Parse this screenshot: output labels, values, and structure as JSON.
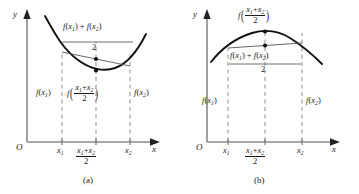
{
  "figure": {
    "colors": {
      "axis": "#8a8a8a",
      "curve": "#111111",
      "chord": "#555555",
      "dashed": "#9a9a9a",
      "text": "#1a1a1a",
      "background": "#ffffff"
    },
    "panels": [
      {
        "id": "a",
        "caption": "(a)",
        "kind": "convex",
        "axis": {
          "y_label": "y",
          "x_label": "x",
          "origin_label": "O"
        },
        "ticks": [
          {
            "name": "x1",
            "num": "x",
            "sub": "1"
          },
          {
            "name": "midpoint",
            "num_a": "x",
            "sub_a": "1",
            "op": "+",
            "num_b": "x",
            "sub_b": "2",
            "den": "2"
          },
          {
            "name": "x2",
            "num": "x",
            "sub": "2"
          }
        ],
        "labels": {
          "average_of_values": {
            "num": "f(x1) + f(x2)",
            "den": "2"
          },
          "value_at_x1": "f(x1)",
          "value_at_midpoint": {
            "fname": "f",
            "num": "x1 + x2",
            "den": "2"
          },
          "value_at_x2": "f(x2)"
        }
      },
      {
        "id": "b",
        "caption": "(b)",
        "kind": "concave",
        "axis": {
          "y_label": "y",
          "x_label": "x",
          "origin_label": "O"
        },
        "ticks": [
          {
            "name": "x1",
            "num": "x",
            "sub": "1"
          },
          {
            "name": "midpoint",
            "num_a": "x",
            "sub_a": "1",
            "op": "+",
            "num_b": "x",
            "sub_b": "2",
            "den": "2"
          },
          {
            "name": "x2",
            "num": "x",
            "sub": "2"
          }
        ],
        "labels": {
          "value_at_midpoint": {
            "fname": "f",
            "num": "x1 + x2",
            "den": "2"
          },
          "average_of_values": {
            "num": "f(x1) + f(x2)",
            "den": "2"
          },
          "value_at_x1": "f(x1)",
          "value_at_x2": "f(x2)"
        }
      }
    ]
  },
  "chart_data": {
    "type": "line",
    "xlabel": "x",
    "ylabel": "y",
    "grid": false,
    "legend": null,
    "panels": [
      {
        "label": "(a)",
        "description": "Convex (upward-opening) curve: value at midpoint lies below the average of endpoint values",
        "relation": "f((x1+x2)/2) < (f(x1)+f(x2))/2",
        "x": [
          0.3,
          0.45,
          0.6,
          0.75,
          0.9,
          1.05,
          1.2,
          1.35,
          1.5
        ],
        "y": [
          5.4,
          4.05,
          3.0,
          2.25,
          1.85,
          1.78,
          2.05,
          2.7,
          3.65
        ],
        "x1": 0.62,
        "x2": 1.3,
        "midpoint": 0.96,
        "f_x1": 2.88,
        "f_x2": 2.5,
        "f_mid": 1.8,
        "chord_mid_value": 2.69,
        "markers": [
          {
            "name": "chord-midpoint-dot",
            "x": 0.96,
            "y": 2.69
          },
          {
            "name": "curve-midpoint-dot",
            "x": 0.96,
            "y": 1.8
          }
        ]
      },
      {
        "label": "(b)",
        "description": "Concave (downward-opening) curve: value at midpoint lies above the average of endpoint values",
        "relation": "f((x1+x2)/2) > (f(x1)+f(x2))/2",
        "x": [
          0.3,
          0.45,
          0.6,
          0.75,
          0.9,
          1.05,
          1.2,
          1.35,
          1.5
        ],
        "y": [
          2.1,
          3.05,
          3.75,
          4.25,
          4.5,
          4.52,
          4.3,
          3.82,
          3.1
        ],
        "x1": 0.62,
        "x2": 1.34,
        "midpoint": 0.98,
        "f_x1": 3.82,
        "f_x2": 3.88,
        "f_mid": 4.52,
        "chord_mid_value": 3.92,
        "markers": [
          {
            "name": "curve-midpoint-dot",
            "x": 0.98,
            "y": 4.52
          },
          {
            "name": "chord-midpoint-dot",
            "x": 0.98,
            "y": 3.92
          }
        ]
      }
    ]
  }
}
